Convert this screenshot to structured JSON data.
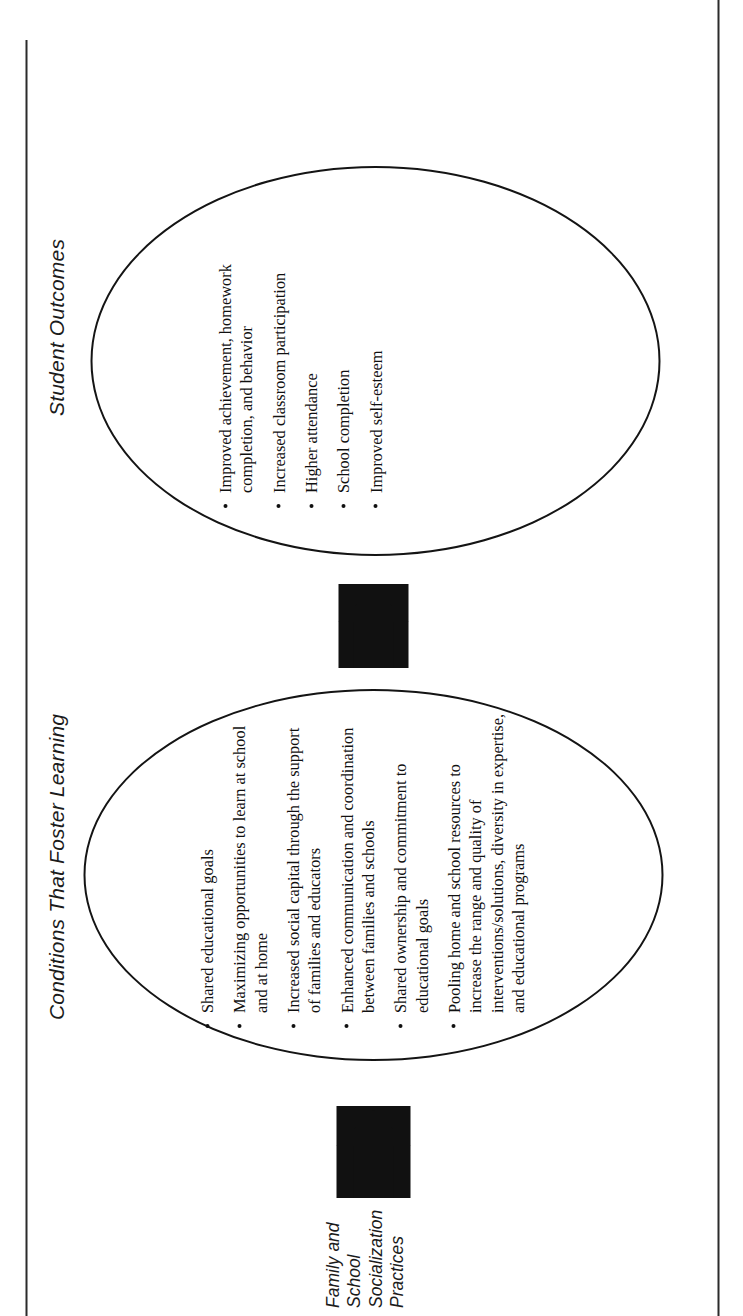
{
  "figure": {
    "orientation": "rotated-90-ccw",
    "type": "flow-diagram",
    "colors": {
      "ink": "#111111",
      "rule": "#2b2b2b",
      "background": "#ffffff"
    }
  },
  "rules": {
    "top_rule_label": "page-rule-top",
    "bottom_rule_label": "page-rule-bottom"
  },
  "caption": {
    "lines": [
      "Family and",
      "School",
      "Socialization",
      "Practices"
    ]
  },
  "arrows": [
    {
      "name": "arrow-practices-to-conditions",
      "direction": "right"
    },
    {
      "name": "arrow-conditions-to-outcomes",
      "direction": "right"
    }
  ],
  "stages": [
    {
      "id": "conditions",
      "heading": "Conditions That Foster Learning",
      "bullets": [
        "Shared educational goals",
        "Maximizing opportunities to learn at school and at home",
        "Increased social capital through the support of families and educators",
        "Enhanced communication and coordination between families and schools",
        "Shared ownership and commitment to educational goals",
        "Pooling home and school resources to increase the range and quality of interventions/solutions, diversity in expertise, and educational programs"
      ]
    },
    {
      "id": "outcomes",
      "heading": "Student Outcomes",
      "bullets": [
        "Improved achievement, homework completion, and behavior",
        "Increased classroom participation",
        "Higher attendance",
        "School completion",
        "Improved self-esteem"
      ]
    }
  ]
}
